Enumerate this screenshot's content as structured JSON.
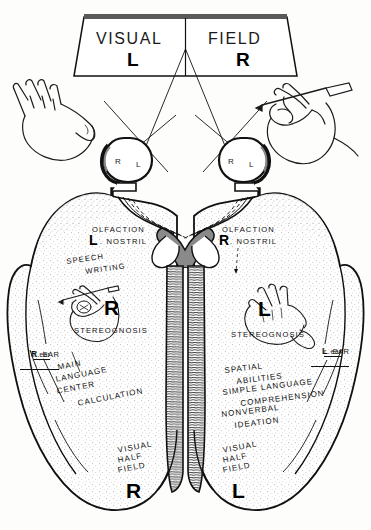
{
  "figure": {
    "view": "inferior (ventral) view of cerebral hemispheres",
    "ink_color": "#111111",
    "paper_color": "#fdfdfc"
  },
  "banner": {
    "word_left": "VISUAL",
    "word_right": "FIELD",
    "letter_left": "L",
    "letter_right": "R"
  },
  "hands": {
    "left_hand_label": "left-hand-open",
    "right_hand_label": "right-hand-writing-with-pen"
  },
  "eyes": {
    "left_eye": {
      "nasal": "R",
      "temporal": "L"
    },
    "right_eye": {
      "nasal": "R",
      "temporal": "L"
    }
  },
  "left_hemisphere": {
    "olfaction": "OLFACTION",
    "nostril_letter": "L",
    "nostril": ". NOSTRIL",
    "speech": "SPEECH",
    "writing": "WRITING",
    "hand_letter": "R",
    "stereognosis": "STEREOGNOSIS",
    "ear_big_letter": "R",
    "ear_big_rest": ". EAR",
    "ear_small": "l. ear",
    "functions": [
      "MAIN",
      "LANGUAGE",
      "CENTER",
      "CALCULATION"
    ],
    "visual_half_field": [
      "VISUAL",
      "HALF",
      "FIELD"
    ],
    "visual_half_field_letter": "R"
  },
  "right_hemisphere": {
    "olfaction": "OLFACTION",
    "nostril_letter": "R",
    "nostril": ". NOSTRIL",
    "hand_letter": "L",
    "stereognosis": "STEREOGNOSIS",
    "ear_big_letter": "L",
    "ear_big_rest": ". EAR",
    "ear_small": "r. ear",
    "functions": [
      "SPATIAL",
      "ABILITIES",
      "SIMPLE LANGUAGE",
      "COMPREHENSION",
      "NONVERBAL",
      "IDEATION"
    ],
    "visual_half_field": [
      "VISUAL",
      "HALF",
      "FIELD"
    ],
    "visual_half_field_letter": "L"
  },
  "anatomy": {
    "optic_chiasm": "optic-chiasm",
    "brain_stem": "brain-stem",
    "temporal_lobe": "temporal-lobe",
    "occipital_lobe": "occipital-lobe"
  }
}
